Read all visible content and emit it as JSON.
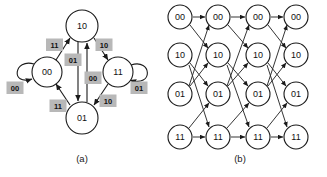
{
  "figure": {
    "panels": [
      {
        "id": "a",
        "caption": "(a)",
        "caption_x": 82,
        "caption_y": 158,
        "type": "state-transition-diagram",
        "states": [
          {
            "label": "10",
            "cx": 82,
            "cy": 26,
            "r": 16
          },
          {
            "label": "00",
            "cx": 47,
            "cy": 72,
            "r": 15
          },
          {
            "label": "11",
            "cx": 118,
            "cy": 72,
            "r": 15
          },
          {
            "label": "01",
            "cx": 82,
            "cy": 118,
            "r": 16
          }
        ],
        "transitions": [
          {
            "from": "00",
            "to": "00",
            "input": "00",
            "kind": "self-left"
          },
          {
            "from": "00",
            "to": "10",
            "input": "11",
            "kind": "arc"
          },
          {
            "from": "10",
            "to": "01",
            "input": "01",
            "kind": "straight"
          },
          {
            "from": "01",
            "to": "10",
            "input": "00",
            "kind": "straight"
          },
          {
            "from": "10",
            "to": "11",
            "input": "10",
            "kind": "arc"
          },
          {
            "from": "11",
            "to": "01",
            "input": "10",
            "kind": "arc"
          },
          {
            "from": "01",
            "to": "00",
            "input": "11",
            "kind": "arc"
          },
          {
            "from": "11",
            "to": "11",
            "input": "01",
            "kind": "self-right"
          }
        ],
        "edge_tags": [
          {
            "text": "11",
            "x": 55,
            "y": 45
          },
          {
            "text": "01",
            "x": 73,
            "y": 60
          },
          {
            "text": "10",
            "x": 104,
            "y": 45
          },
          {
            "text": "00",
            "x": 15,
            "y": 88
          },
          {
            "text": "00",
            "x": 93,
            "y": 78
          },
          {
            "text": "01",
            "x": 139,
            "y": 88
          },
          {
            "text": "11",
            "x": 58,
            "y": 106
          },
          {
            "text": "10",
            "x": 108,
            "y": 101
          }
        ]
      },
      {
        "id": "b",
        "caption": "(b)",
        "caption_x": 76,
        "caption_y": 158,
        "type": "trellis-diagram",
        "row_labels": [
          "00",
          "10",
          "01",
          "11"
        ],
        "row_y": [
          17,
          55,
          94,
          137
        ],
        "column_x": [
          16,
          54,
          94,
          132
        ],
        "node_r": 12,
        "stage_transitions": [
          {
            "from": "00",
            "to": "00"
          },
          {
            "from": "00",
            "to": "10"
          },
          {
            "from": "10",
            "to": "01"
          },
          {
            "from": "10",
            "to": "11"
          },
          {
            "from": "01",
            "to": "00"
          },
          {
            "from": "01",
            "to": "10"
          },
          {
            "from": "11",
            "to": "01"
          },
          {
            "from": "11",
            "to": "11"
          }
        ],
        "stages": 3
      }
    ]
  },
  "colors": {
    "stroke": "#1a1a1a",
    "tag_background": "#b8b8b8",
    "node_fill": "#ffffff",
    "page_background": "#ffffff"
  }
}
